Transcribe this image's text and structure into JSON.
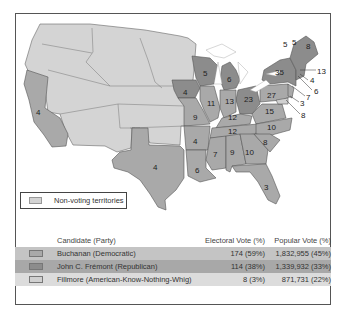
{
  "map": {
    "state_electoral_votes": [
      {
        "state": "California",
        "votes": "4",
        "winner": "Buchanan"
      },
      {
        "state": "Texas",
        "votes": "4",
        "winner": "Buchanan"
      },
      {
        "state": "Iowa",
        "votes": "4",
        "winner": "Frémont"
      },
      {
        "state": "Wisconsin",
        "votes": "5",
        "winner": "Frémont"
      },
      {
        "state": "Michigan",
        "votes": "6",
        "winner": "Frémont"
      },
      {
        "state": "Ohio",
        "votes": "23",
        "winner": "Frémont"
      },
      {
        "state": "New York",
        "votes": "35",
        "winner": "Frémont"
      },
      {
        "state": "Maine",
        "votes": "8",
        "winner": "Frémont"
      },
      {
        "state": "Vermont",
        "votes": "5",
        "winner": "Frémont"
      },
      {
        "state": "New Hampshire",
        "votes": "5",
        "winner": "Frémont"
      },
      {
        "state": "Massachusetts",
        "votes": "13",
        "winner": "Frémont"
      },
      {
        "state": "Rhode Island",
        "votes": "4",
        "winner": "Frémont"
      },
      {
        "state": "Connecticut",
        "votes": "6",
        "winner": "Frémont"
      },
      {
        "state": "New Jersey",
        "votes": "7",
        "winner": "Buchanan"
      },
      {
        "state": "Delaware",
        "votes": "3",
        "winner": "Buchanan"
      },
      {
        "state": "Maryland",
        "votes": "8",
        "winner": "Fillmore"
      },
      {
        "state": "Pennsylvania",
        "votes": "27",
        "winner": "Buchanan"
      },
      {
        "state": "Illinois",
        "votes": "11",
        "winner": "Buchanan"
      },
      {
        "state": "Indiana",
        "votes": "13",
        "winner": "Buchanan"
      },
      {
        "state": "Missouri",
        "votes": "9",
        "winner": "Buchanan"
      },
      {
        "state": "Kentucky",
        "votes": "12",
        "winner": "Buchanan"
      },
      {
        "state": "Virginia",
        "votes": "15",
        "winner": "Buchanan"
      },
      {
        "state": "Tennessee",
        "votes": "12",
        "winner": "Buchanan"
      },
      {
        "state": "North Carolina",
        "votes": "10",
        "winner": "Buchanan"
      },
      {
        "state": "Arkansas",
        "votes": "4",
        "winner": "Buchanan"
      },
      {
        "state": "South Carolina",
        "votes": "8",
        "winner": "Buchanan"
      },
      {
        "state": "Mississippi",
        "votes": "7",
        "winner": "Buchanan"
      },
      {
        "state": "Alabama",
        "votes": "9",
        "winner": "Buchanan"
      },
      {
        "state": "Georgia",
        "votes": "10",
        "winner": "Buchanan"
      },
      {
        "state": "Louisiana",
        "votes": "6",
        "winner": "Buchanan"
      },
      {
        "state": "Florida",
        "votes": "3",
        "winner": "Buchanan"
      }
    ],
    "legend": {
      "label": "Non-voting territories",
      "color": "#d4d4d4"
    }
  },
  "colors": {
    "buchanan": "#a9a9a9",
    "fremont": "#8c8c8c",
    "fillmore": "#d0d0d0",
    "territory": "#d4d4d4",
    "water": "#ffffff"
  },
  "results": {
    "headers": {
      "candidate": "Candidate (Party)",
      "electoral": "Electoral Vote (%)",
      "popular": "Popular Vote (%)"
    },
    "rows": [
      {
        "candidate": "Buchanan (Democratic)",
        "electoral": "174 (59%)",
        "popular": "1,832,955 (45%)",
        "swatch": "#a9a9a9",
        "row_bg": "#c4c4c4"
      },
      {
        "candidate": "John C. Frémont (Republican)",
        "electoral": "114 (38%)",
        "popular": "1,339,932 (33%)",
        "swatch": "#8c8c8c",
        "row_bg": "#a8a8a8"
      },
      {
        "candidate": "Fillmore (American-Know-Nothing-Whig)",
        "electoral": "8 (3%)",
        "popular": "871,731 (22%)",
        "swatch": "#d0d0d0",
        "row_bg": "#dcdcdc"
      }
    ]
  }
}
